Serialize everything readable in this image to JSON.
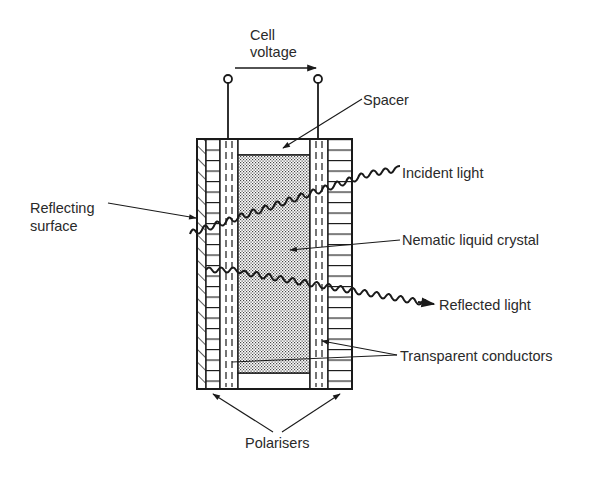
{
  "diagram": {
    "type": "reflective LCD cell cross-section",
    "colors": {
      "ink": "#1a1a1a",
      "stipple": "#bdbdbd",
      "background": "#ffffff"
    },
    "labels": {
      "cell_voltage_line1": "Cell",
      "cell_voltage_line2": "voltage",
      "spacer": "Spacer",
      "incident_light": "Incident light",
      "reflecting_surface_line1": "Reflecting",
      "reflecting_surface_line2": "surface",
      "nematic_liquid_crystal": "Nematic liquid crystal",
      "reflected_light": "Reflected light",
      "transparent_conductors": "Transparent conductors",
      "polarisers": "Polarisers"
    }
  }
}
